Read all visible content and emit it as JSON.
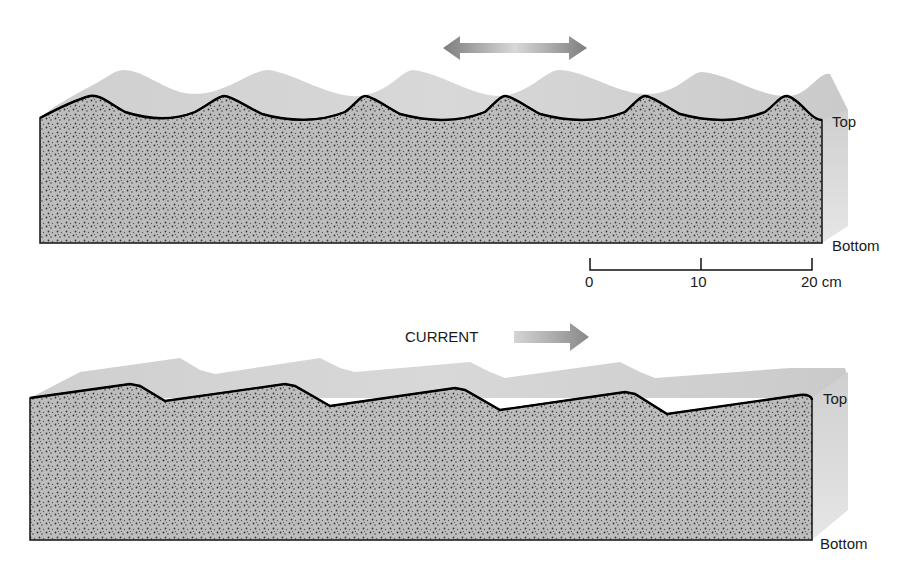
{
  "figure": {
    "top_panel": {
      "description": "Symmetrical ripple marks formed by oscillating (wave) motion",
      "motion_indicator": "double-headed-arrow",
      "labels": {
        "top": "Top",
        "bottom": "Bottom"
      }
    },
    "scale_bar": {
      "ticks": [
        "0",
        "10",
        "20 cm"
      ]
    },
    "bottom_panel": {
      "description": "Asymmetrical ripple marks formed by unidirectional current",
      "motion_indicator": "right-arrow",
      "current_label": "CURRENT",
      "labels": {
        "top": "Top",
        "bottom": "Bottom"
      }
    },
    "colors": {
      "sediment_fill": "#b9b9b9",
      "surface_fill": "#d4d4d4",
      "side_fill": "#dcdcdc",
      "outline": "#111111",
      "arrow": "#8a8a8a"
    }
  }
}
